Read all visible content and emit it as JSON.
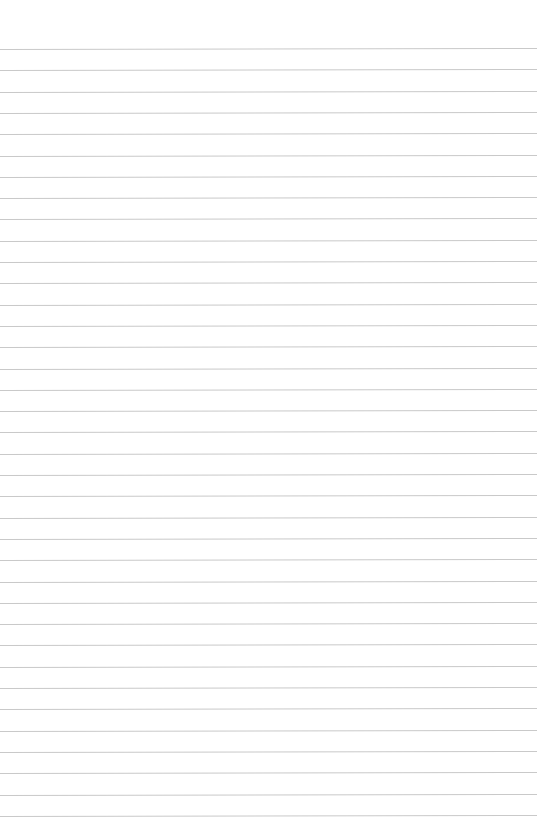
{
  "page": {
    "type": "blank ruled paper",
    "background_color": "#ffffff",
    "rule_color": "#c9c9c9",
    "rule_count": 37,
    "first_rule_y": 49,
    "rule_spacing": 21.3,
    "text_content": []
  }
}
